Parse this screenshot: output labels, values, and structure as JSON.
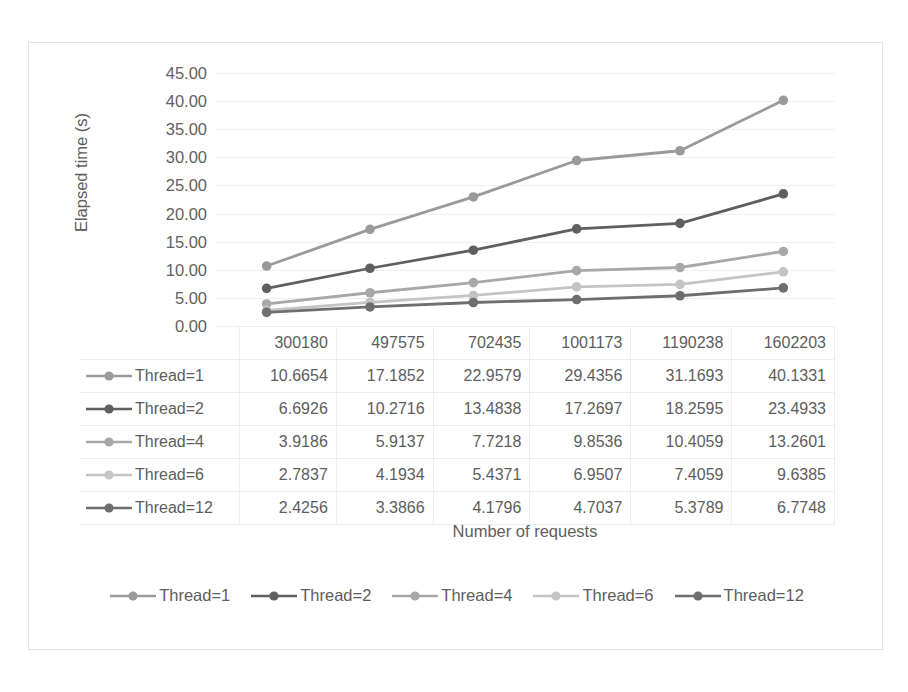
{
  "chart_data": {
    "type": "line",
    "title": "",
    "xlabel": "Number of requests",
    "ylabel": "Elapsed time (s)",
    "categories": [
      "300180",
      "497575",
      "702435",
      "1001173",
      "1190238",
      "1602203"
    ],
    "ylim": [
      0,
      45
    ],
    "ytick_step": 5,
    "ytick_labels": [
      "45.00",
      "40.00",
      "35.00",
      "30.00",
      "25.00",
      "20.00",
      "15.00",
      "10.00",
      "5.00",
      "0.00"
    ],
    "grid": true,
    "legend_position": "bottom",
    "has_data_table": true,
    "series": [
      {
        "name": "Thread=1",
        "color": "#9a9a9a",
        "values": [
          10.6654,
          17.1852,
          22.9579,
          29.4356,
          31.1693,
          40.1331
        ]
      },
      {
        "name": "Thread=2",
        "color": "#5f5f5f",
        "values": [
          6.6926,
          10.2716,
          13.4838,
          17.2697,
          18.2595,
          23.4933
        ]
      },
      {
        "name": "Thread=4",
        "color": "#a8a8a8",
        "values": [
          3.9186,
          5.9137,
          7.7218,
          9.8536,
          10.4059,
          13.2601
        ]
      },
      {
        "name": "Thread=6",
        "color": "#c4c4c4",
        "values": [
          2.7837,
          4.1934,
          5.4371,
          6.9507,
          7.4059,
          9.6385
        ]
      },
      {
        "name": "Thread=12",
        "color": "#6e6e6e",
        "values": [
          2.4256,
          3.3866,
          4.1796,
          4.7037,
          5.3789,
          6.7748
        ]
      }
    ]
  },
  "table": {
    "column_headers": [
      "300180",
      "497575",
      "702435",
      "1001173",
      "1190238",
      "1602203"
    ],
    "rows": [
      {
        "label": "Thread=1",
        "cells": [
          "10.6654",
          "17.1852",
          "22.9579",
          "29.4356",
          "31.1693",
          "40.1331"
        ]
      },
      {
        "label": "Thread=2",
        "cells": [
          "6.6926",
          "10.2716",
          "13.4838",
          "17.2697",
          "18.2595",
          "23.4933"
        ]
      },
      {
        "label": "Thread=4",
        "cells": [
          "3.9186",
          "5.9137",
          "7.7218",
          "9.8536",
          "10.4059",
          "13.2601"
        ]
      },
      {
        "label": "Thread=6",
        "cells": [
          "2.7837",
          "4.1934",
          "5.4371",
          "6.9507",
          "7.4059",
          "9.6385"
        ]
      },
      {
        "label": "Thread=12",
        "cells": [
          "2.4256",
          "3.3866",
          "4.1796",
          "4.7037",
          "5.3789",
          "6.7748"
        ]
      }
    ]
  },
  "legend": {
    "items": [
      {
        "label": "Thread=1",
        "color": "#9a9a9a"
      },
      {
        "label": "Thread=2",
        "color": "#5f5f5f"
      },
      {
        "label": "Thread=4",
        "color": "#a8a8a8"
      },
      {
        "label": "Thread=6",
        "color": "#c4c4c4"
      },
      {
        "label": "Thread=12",
        "color": "#6e6e6e"
      }
    ]
  },
  "colors": {
    "frame_border": "#e2e2e2",
    "gridline": "#f0f0f0",
    "text": "#5d5d5d",
    "table_border": "#ededed"
  }
}
